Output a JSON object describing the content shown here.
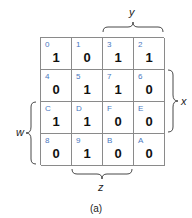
{
  "kmap": {
    "rows": [
      [
        {
          "index": "0",
          "value": "1"
        },
        {
          "index": "1",
          "value": "0"
        },
        {
          "index": "3",
          "value": "1"
        },
        {
          "index": "2",
          "value": "1"
        }
      ],
      [
        {
          "index": "4",
          "value": "0"
        },
        {
          "index": "5",
          "value": "1"
        },
        {
          "index": "7",
          "value": "1"
        },
        {
          "index": "6",
          "value": "0"
        }
      ],
      [
        {
          "index": "C",
          "value": "1"
        },
        {
          "index": "D",
          "value": "1"
        },
        {
          "index": "F",
          "value": "0"
        },
        {
          "index": "E",
          "value": "0"
        }
      ],
      [
        {
          "index": "8",
          "value": "0"
        },
        {
          "index": "9",
          "value": "1"
        },
        {
          "index": "B",
          "value": "0"
        },
        {
          "index": "A",
          "value": "0"
        }
      ]
    ],
    "labels": {
      "y": "y",
      "x": "x",
      "w": "w",
      "z": "z"
    },
    "caption": "(a)"
  }
}
